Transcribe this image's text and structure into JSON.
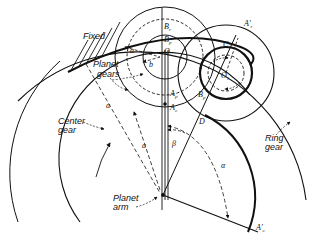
{
  "figure": {
    "type": "planetary gear train geometry diagram",
    "stroke_color": "#111111",
    "background": "#ffffff"
  },
  "labels": {
    "fixed": "Fixed",
    "planet_gears_line1": "Planet",
    "planet_gears_line2": "gears",
    "center_gear_line1": "Center",
    "center_gear_line2": "gear",
    "ring_gear_line1": "Ring",
    "ring_gear_line2": "gear",
    "planet_arm_line1": "Planet",
    "planet_arm_line2": "arm"
  },
  "points": {
    "B_r": "B",
    "B_r_sub": "r",
    "B_p": "B",
    "B_p_sub": "p",
    "O": "O",
    "O1": "O",
    "O1_sub": "1",
    "A_p": "A",
    "A_p_sub": "p",
    "A_c": "A",
    "A_c_sub": "c",
    "C": "C",
    "D": "D",
    "B_p2": "B",
    "B_p2_sub": "p",
    "A_r_prime": "A'",
    "A_r_prime_sub": "r",
    "A_c_prime": "A'",
    "A_c_prime_sub": "c"
  },
  "dimensions": {
    "a_top": "a",
    "b": "b",
    "a_left": "a",
    "a_mid": "a",
    "beta": "β",
    "alpha": "α"
  }
}
